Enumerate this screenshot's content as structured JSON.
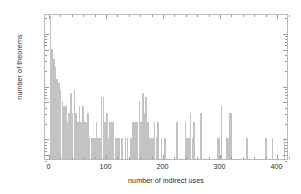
{
  "chart_data": {
    "type": "bar",
    "title": "",
    "xlabel": "number of indirect uses",
    "ylabel": "number of theorems",
    "yscale": "log",
    "xlim": [
      -8,
      420
    ],
    "ylim": [
      0.4,
      230
    ],
    "grid": false,
    "legend": null,
    "bar_color": "#c3c3c3",
    "axis_color": "#b9b9b9",
    "text_color": "#2b2b2b",
    "xticks": [
      0,
      100,
      200,
      300,
      400
    ],
    "xticklabels": [
      "0",
      "100",
      "200",
      "300",
      "400"
    ],
    "yticks": [
      0.5,
      1,
      5,
      10,
      50,
      100
    ],
    "yticklabels": [
      "0.5",
      "1",
      "5",
      "10",
      "50",
      "100"
    ],
    "bin_width": 3,
    "bars": [
      {
        "x": 0,
        "y": 200
      },
      {
        "x": 3,
        "y": 48
      },
      {
        "x": 6,
        "y": 31
      },
      {
        "x": 9,
        "y": 22
      },
      {
        "x": 12,
        "y": 13
      },
      {
        "x": 15,
        "y": 11
      },
      {
        "x": 18,
        "y": 8
      },
      {
        "x": 21,
        "y": 5
      },
      {
        "x": 24,
        "y": 4
      },
      {
        "x": 27,
        "y": 4
      },
      {
        "x": 30,
        "y": 2
      },
      {
        "x": 33,
        "y": 3
      },
      {
        "x": 36,
        "y": 7
      },
      {
        "x": 39,
        "y": 3
      },
      {
        "x": 42,
        "y": 8
      },
      {
        "x": 45,
        "y": 3
      },
      {
        "x": 48,
        "y": 2
      },
      {
        "x": 51,
        "y": 4
      },
      {
        "x": 54,
        "y": 2
      },
      {
        "x": 57,
        "y": 4
      },
      {
        "x": 60,
        "y": 2
      },
      {
        "x": 63,
        "y": 2
      },
      {
        "x": 66,
        "y": 3
      },
      {
        "x": 69,
        "y": 1
      },
      {
        "x": 72,
        "y": 1
      },
      {
        "x": 75,
        "y": 1
      },
      {
        "x": 78,
        "y": 1
      },
      {
        "x": 81,
        "y": 2
      },
      {
        "x": 84,
        "y": 1
      },
      {
        "x": 87,
        "y": 1
      },
      {
        "x": 90,
        "y": 6
      },
      {
        "x": 93,
        "y": 6
      },
      {
        "x": 96,
        "y": 2
      },
      {
        "x": 99,
        "y": 3
      },
      {
        "x": 102,
        "y": 1
      },
      {
        "x": 105,
        "y": 2
      },
      {
        "x": 108,
        "y": 2
      },
      {
        "x": 111,
        "y": 2
      },
      {
        "x": 114,
        "y": 1
      },
      {
        "x": 117,
        "y": 1
      },
      {
        "x": 120,
        "y": 1
      },
      {
        "x": 126,
        "y": 1
      },
      {
        "x": 132,
        "y": 1
      },
      {
        "x": 135,
        "y": 1
      },
      {
        "x": 141,
        "y": 1
      },
      {
        "x": 144,
        "y": 2
      },
      {
        "x": 147,
        "y": 2
      },
      {
        "x": 150,
        "y": 2
      },
      {
        "x": 153,
        "y": 2
      },
      {
        "x": 156,
        "y": 5
      },
      {
        "x": 159,
        "y": 2
      },
      {
        "x": 162,
        "y": 7
      },
      {
        "x": 165,
        "y": 3
      },
      {
        "x": 168,
        "y": 6
      },
      {
        "x": 171,
        "y": 2
      },
      {
        "x": 174,
        "y": 1
      },
      {
        "x": 177,
        "y": 1
      },
      {
        "x": 180,
        "y": 1
      },
      {
        "x": 183,
        "y": 2
      },
      {
        "x": 186,
        "y": 1
      },
      {
        "x": 189,
        "y": 2
      },
      {
        "x": 195,
        "y": 1
      },
      {
        "x": 201,
        "y": 1
      },
      {
        "x": 222,
        "y": 2
      },
      {
        "x": 237,
        "y": 2
      },
      {
        "x": 240,
        "y": 1
      },
      {
        "x": 243,
        "y": 1
      },
      {
        "x": 246,
        "y": 3
      },
      {
        "x": 249,
        "y": 1
      },
      {
        "x": 252,
        "y": 2
      },
      {
        "x": 264,
        "y": 3
      },
      {
        "x": 294,
        "y": 1
      },
      {
        "x": 297,
        "y": 1
      },
      {
        "x": 300,
        "y": 4
      },
      {
        "x": 309,
        "y": 1
      },
      {
        "x": 312,
        "y": 1
      },
      {
        "x": 315,
        "y": 3
      },
      {
        "x": 318,
        "y": 3
      },
      {
        "x": 345,
        "y": 1
      },
      {
        "x": 378,
        "y": 1
      },
      {
        "x": 390,
        "y": 1
      },
      {
        "x": 411,
        "y": 1
      },
      {
        "x": 417,
        "y": 1
      }
    ]
  }
}
